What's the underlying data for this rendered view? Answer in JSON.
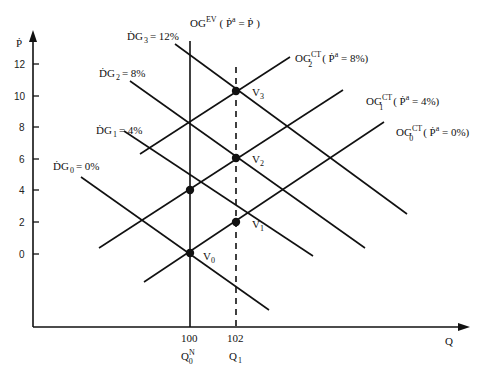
{
  "diagram": {
    "axes": {
      "y_label": "Ṗ",
      "x_label": "Q",
      "y_ticks": [
        "12",
        "10",
        "8",
        "6",
        "4",
        "2",
        "0"
      ],
      "x_ticks": [
        "100",
        "102"
      ],
      "x_tick_sublabels": {
        "q0_main": "Q",
        "q0_sup": "N",
        "q0_sub": "0",
        "q1_main": "Q",
        "q1_sub": "1"
      }
    },
    "demand_curves": [
      {
        "main": "ḊG",
        "sub": "0",
        "value": "= 0%"
      },
      {
        "main": "ḊG",
        "sub": "1",
        "value": "= 4%"
      },
      {
        "main": "ḊG",
        "sub": "2",
        "value": "= 8%"
      },
      {
        "main": "ḊG",
        "sub": "3",
        "value": "= 12%"
      }
    ],
    "supply_curves": [
      {
        "main": "OG",
        "sup": "CT",
        "sub": "0",
        "paren": "( Ṗ",
        "paren_sup": "a",
        "paren_end": " = 0%)"
      },
      {
        "main": "OG",
        "sup": "CT",
        "sub": "1",
        "paren": "( Ṗ",
        "paren_sup": "a",
        "paren_end": " = 4%)"
      },
      {
        "main": "OG",
        "sup": "CT",
        "sub": "2",
        "paren": "( Ṗ",
        "paren_sup": "a",
        "paren_end": " = 8%)"
      }
    ],
    "long_run": {
      "main": "OG",
      "sup": "EV",
      "paren": "( Ṗ",
      "paren_sup": "a",
      "paren_end": " = Ṗ )"
    },
    "points": [
      {
        "main": "V",
        "sub": "0"
      },
      {
        "main": "V",
        "sub": "1"
      },
      {
        "main": "V",
        "sub": "2"
      },
      {
        "main": "V",
        "sub": "3"
      }
    ]
  }
}
